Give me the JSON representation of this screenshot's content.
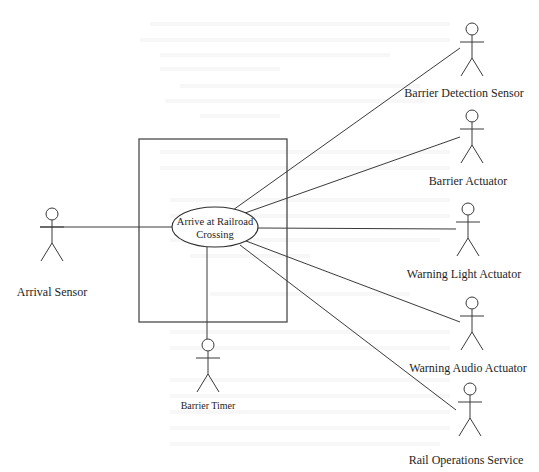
{
  "diagram": {
    "type": "uml-use-case",
    "system_boundary": {
      "x": 139,
      "y": 139,
      "width": 148,
      "height": 183
    },
    "use_case": {
      "label_line1": "Arrive at Railroad",
      "label_line2": "Crossing",
      "cx": 215,
      "cy": 227,
      "rx": 43,
      "ry": 20
    },
    "actors": [
      {
        "id": "arrival-sensor",
        "name": "Arrival Sensor",
        "head_x": 52,
        "head_y": 214,
        "label_y": 286,
        "small": false
      },
      {
        "id": "barrier-detection-sensor",
        "name": "Barrier Detection Sensor",
        "head_x": 472,
        "head_y": 29,
        "label_y": 87,
        "small": false
      },
      {
        "id": "barrier-actuator",
        "name": "Barrier Actuator",
        "head_x": 472,
        "head_y": 116,
        "label_y": 175,
        "small": false
      },
      {
        "id": "warning-light-actuator",
        "name": "Warning Light Actuator",
        "head_x": 468,
        "head_y": 209,
        "label_y": 268,
        "small": false
      },
      {
        "id": "warning-audio-actuator",
        "name": "Warning Audio Actuator",
        "head_x": 472,
        "head_y": 303,
        "label_y": 362,
        "small": false
      },
      {
        "id": "rail-operations-service",
        "name": "Rail Operations Service",
        "head_x": 470,
        "head_y": 389,
        "label_y": 454,
        "small": false
      },
      {
        "id": "barrier-timer",
        "name": "Barrier Timer",
        "head_x": 208,
        "head_y": 345,
        "label_y": 401,
        "small": true
      }
    ],
    "associations": [
      {
        "actor": "arrival-sensor",
        "x1": 40,
        "y1": 227,
        "x2": 172,
        "y2": 227
      },
      {
        "actor": "barrier-detection-sensor",
        "x1": 233,
        "y1": 210,
        "x2": 460,
        "y2": 48
      },
      {
        "actor": "barrier-actuator",
        "x1": 245,
        "y1": 213,
        "x2": 460,
        "y2": 137
      },
      {
        "actor": "warning-light-actuator",
        "x1": 258,
        "y1": 228,
        "x2": 456,
        "y2": 229
      },
      {
        "actor": "warning-audio-actuator",
        "x1": 246,
        "y1": 241,
        "x2": 460,
        "y2": 322
      },
      {
        "actor": "rail-operations-service",
        "x1": 240,
        "y1": 245,
        "x2": 456,
        "y2": 410
      },
      {
        "actor": "barrier-timer",
        "x1": 207,
        "y1": 247,
        "x2": 207,
        "y2": 339
      }
    ]
  }
}
